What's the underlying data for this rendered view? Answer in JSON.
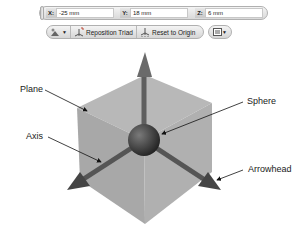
{
  "coordinate_bar": {
    "fields": [
      {
        "axis": "X:",
        "value": "-25 mm"
      },
      {
        "axis": "Y:",
        "value": "18 mm"
      },
      {
        "axis": "Z:",
        "value": "6 mm"
      }
    ]
  },
  "toolbar": {
    "snap_dropdown_icon": "snap-icon",
    "reposition_label": "Reposition Triad",
    "reset_label": "Reset to Origin",
    "display_dropdown_icon": "display-options-icon"
  },
  "diagram": {
    "callouts": {
      "plane": "Plane",
      "axis": "Axis",
      "sphere": "Sphere",
      "arrowhead": "Arrowhead"
    },
    "colors": {
      "plane": "#a9a9a9",
      "axis": "#5e5e5e",
      "sphere": "#3a3a3a",
      "background": "#ffffff"
    }
  }
}
